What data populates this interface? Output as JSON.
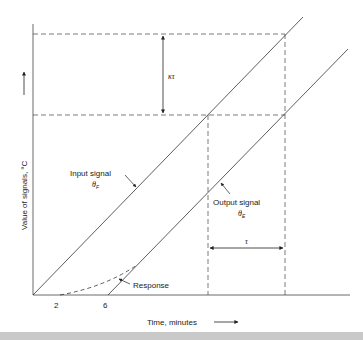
{
  "diagram": {
    "type": "first-order system ramp response",
    "axes": {
      "xlabel": "Time, minutes",
      "ylabel": "Value of signals, °C",
      "x_ticks": [
        "2",
        "6"
      ]
    },
    "curves": {
      "input": {
        "label": "Input signal",
        "symbol": "θ",
        "subscript": "F"
      },
      "output": {
        "label": "Output signal",
        "symbol": "θ",
        "subscript": "E"
      },
      "response": {
        "label": "Response"
      }
    },
    "annotations": {
      "vertical_gap": "κτ",
      "horizontal_lag": "τ"
    },
    "colors": {
      "line": "#333333",
      "background": "#ffffff",
      "bottom_band": "#c9c9c9"
    }
  }
}
